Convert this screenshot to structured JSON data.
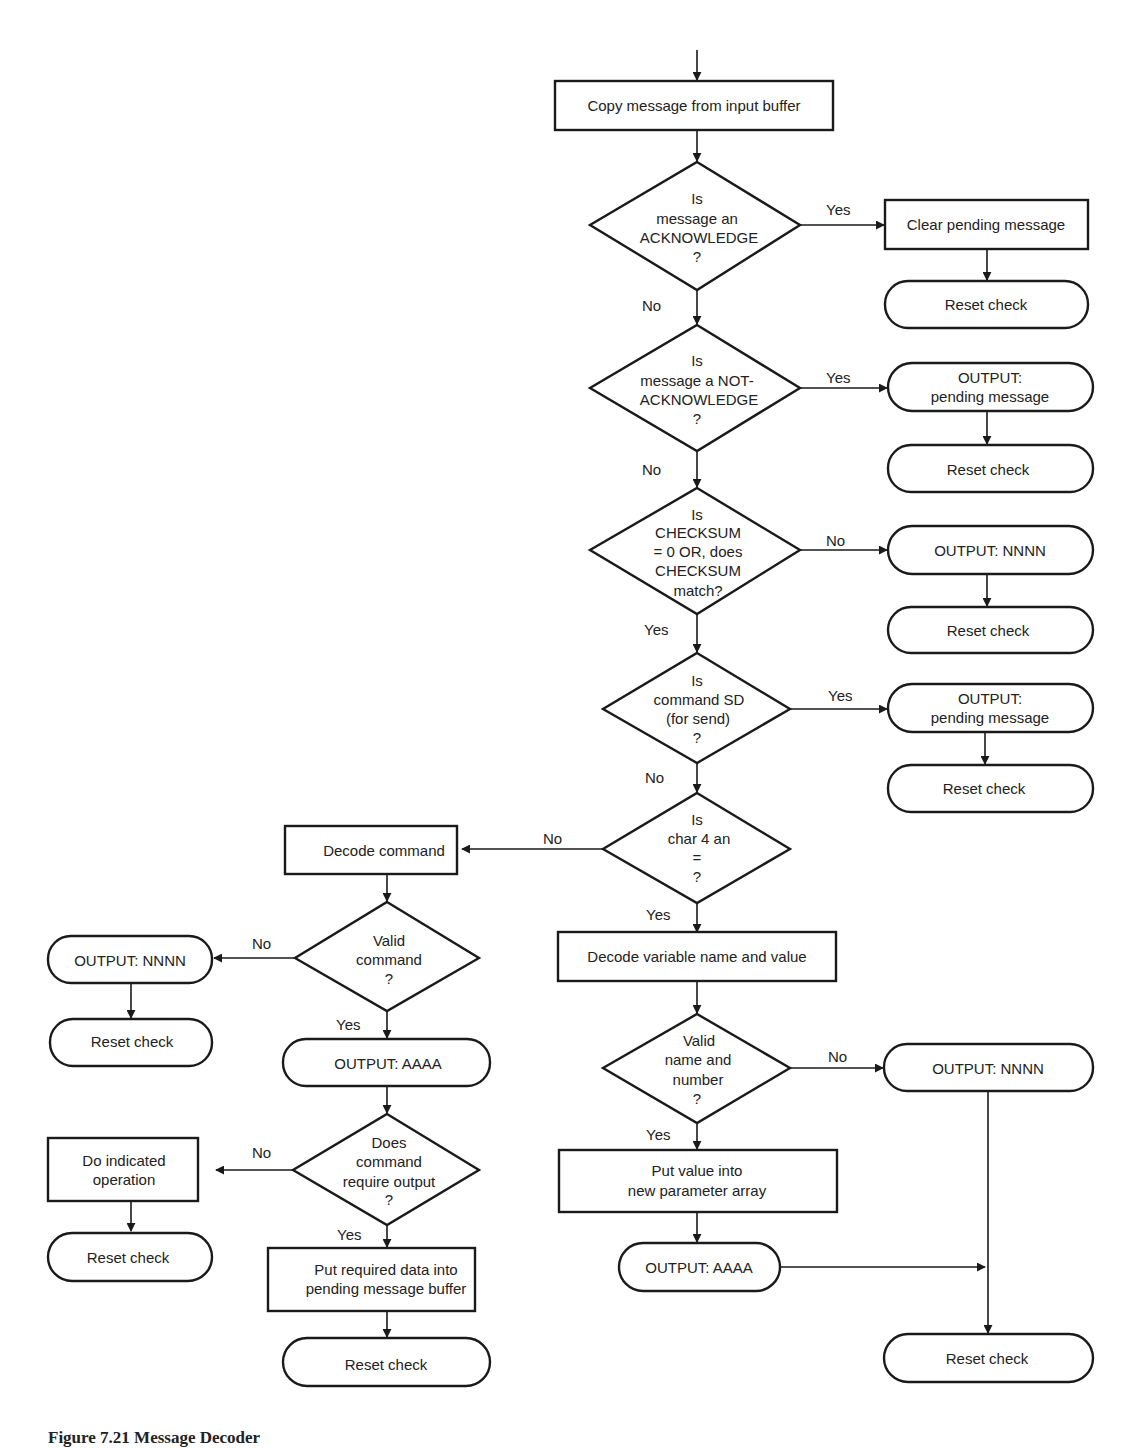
{
  "figure": {
    "caption": "Figure 7.21 Message Decoder"
  },
  "nodes": {
    "copy_message": [
      "Copy message from input buffer"
    ],
    "is_ack": [
      "Is",
      "message an",
      "ACKNOWLEDGE",
      "?"
    ],
    "clear_pending": [
      "Clear pending message"
    ],
    "reset_1": [
      "Reset check"
    ],
    "is_nack": [
      "Is",
      "message a NOT-",
      "ACKNOWLEDGE",
      "?"
    ],
    "output_pending_1": [
      "OUTPUT:",
      "pending message"
    ],
    "reset_2": [
      "Reset check"
    ],
    "is_checksum": [
      "Is",
      "CHECKSUM",
      "= 0  OR, does",
      "CHECKSUM",
      "match?"
    ],
    "output_nnnn_1": [
      "OUTPUT: NNNN"
    ],
    "reset_3": [
      "Reset check"
    ],
    "is_sd": [
      "Is",
      "command SD",
      "(for send)",
      "?"
    ],
    "output_pending_2": [
      "OUTPUT:",
      "pending message"
    ],
    "reset_4": [
      "Reset check"
    ],
    "is_char4": [
      "Is",
      "char 4 an",
      "=",
      "?"
    ],
    "decode_command": [
      "Decode command"
    ],
    "valid_command": [
      "Valid",
      "command",
      "?"
    ],
    "output_nnnn_2": [
      "OUTPUT: NNNN"
    ],
    "reset_5": [
      "Reset check"
    ],
    "output_aaaa_1": [
      "OUTPUT: AAAA"
    ],
    "requires_output": [
      "Does",
      "command",
      "require output",
      "?"
    ],
    "do_operation": [
      "Do indicated",
      "operation"
    ],
    "reset_6": [
      "Reset check"
    ],
    "put_required_data": [
      "Put required data into",
      "pending message buffer"
    ],
    "reset_7": [
      "Reset check"
    ],
    "decode_variable": [
      "Decode variable name and value"
    ],
    "valid_name": [
      "Valid",
      "name and",
      "number",
      "?"
    ],
    "output_nnnn_3": [
      "OUTPUT: NNNN"
    ],
    "put_value": [
      "Put value into",
      "new parameter array"
    ],
    "output_aaaa_2": [
      "OUTPUT: AAAA"
    ],
    "reset_8": [
      "Reset check"
    ]
  },
  "edge_labels": {
    "ack_yes": "Yes",
    "ack_no": "No",
    "nack_yes": "Yes",
    "nack_no": "No",
    "checksum_no": "No",
    "checksum_yes": "Yes",
    "sd_yes": "Yes",
    "sd_no": "No",
    "char4_no": "No",
    "char4_yes": "Yes",
    "valid_cmd_no": "No",
    "valid_cmd_yes": "Yes",
    "req_out_no": "No",
    "req_out_yes": "Yes",
    "valid_name_no": "No",
    "valid_name_yes": "Yes"
  }
}
